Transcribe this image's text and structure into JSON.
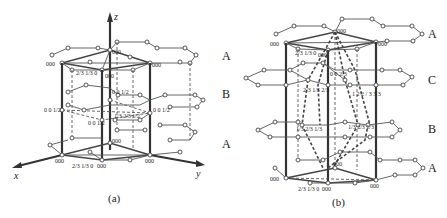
{
  "figure": {
    "panels": [
      {
        "id": "a",
        "caption": "(a)",
        "axes": {
          "x": "x",
          "y": "y",
          "z": "z"
        },
        "layer_labels": [
          "A",
          "B",
          "A"
        ],
        "coordinate_labels": {
          "top_left": "000",
          "top_center": "000",
          "top_right": "000",
          "top_front": "000",
          "top_fraction": "2/3 1/3 0",
          "mid_center": "0 0 1/2",
          "mid_left": "0 0 1/2",
          "mid_right": "0 0 1/2",
          "mid_front": "0 0 1/2",
          "mid_fraction": "1/3 2/3 1/2",
          "bot_left": "000",
          "bot_center": "000",
          "bot_right": "000",
          "bot_front": "000",
          "bot_fraction": "2/3 1/3 0"
        }
      },
      {
        "id": "b",
        "caption": "(b)",
        "layer_labels_right": [
          "A",
          "C",
          "B",
          "A"
        ],
        "layer_labels_left": [
          "A",
          "B",
          "A"
        ],
        "coordinate_labels": {
          "top_left": "000",
          "top_center": "000",
          "top_right": "000",
          "top_front": "000",
          "top_fraction": "2/3 1/3 0",
          "c_layer_a": "0 0 2/3",
          "c_layer_b": "2/3 1/3 2/3",
          "b_layer_a": "1/3 2/3 1/3",
          "b_layer_b": "1/3 2/3 1/3",
          "b_layer_c": "1 2 2 / 3 3 3",
          "bot_center": "000",
          "bot_left": "000",
          "bot_right": "000",
          "bot_front": "000",
          "bot_fraction": "2/3 1/3 0"
        }
      }
    ]
  }
}
